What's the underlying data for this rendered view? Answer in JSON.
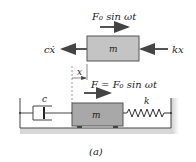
{
  "figure": {
    "caption": "(a)",
    "free_body": {
      "mass_label": "m",
      "applied_force": "F₀ sin ωt",
      "damping_force": "cẋ",
      "spring_force": "kx"
    },
    "system": {
      "mass_label": "m",
      "damper_label": "c",
      "spring_label": "k",
      "displacement_label": "x",
      "force_label": "F = F₀ sin ωt"
    },
    "colors": {
      "mass_fill": "#a8a8a8",
      "ground_shadow": "#cfcfcf",
      "line": "#333333"
    }
  }
}
